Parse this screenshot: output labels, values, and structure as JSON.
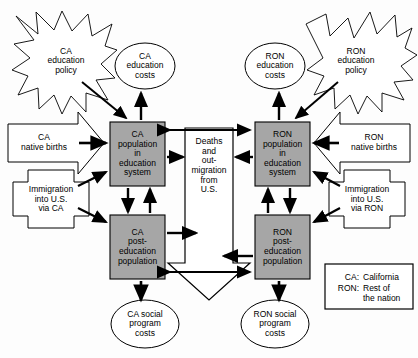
{
  "diagram": {
    "legend": {
      "name": "legend-box",
      "rows": [
        {
          "key": "CA:",
          "value": "California"
        },
        {
          "key": "RON:",
          "value": "Rest of\nthe nation"
        }
      ]
    },
    "nodes": {
      "ca_education_policy": {
        "label": "CA\neducation\npolicy",
        "shape": "starburst",
        "fill": "#ffffff"
      },
      "ca_education_costs": {
        "label": "CA\neducation\ncosts",
        "shape": "ellipse",
        "fill": "#ffffff"
      },
      "ron_education_costs": {
        "label": "RON\neducation\ncosts",
        "shape": "ellipse",
        "fill": "#ffffff"
      },
      "ron_education_policy": {
        "label": "RON\neducation\npolicy",
        "shape": "starburst",
        "fill": "#ffffff"
      },
      "ca_native_births": {
        "label": "CA\nnative births",
        "shape": "arrow-pentagon-right",
        "fill": "#ffffff"
      },
      "ron_native_births": {
        "label": "RON\nnative births",
        "shape": "arrow-pentagon-left",
        "fill": "#ffffff"
      },
      "ca_immigration": {
        "label": "Immigration\ninto U.S.\nvia CA",
        "shape": "cross",
        "fill": "#ffffff"
      },
      "ron_immigration": {
        "label": "Immigration\ninto U.S.\nvia RON",
        "shape": "cross",
        "fill": "#ffffff"
      },
      "ca_population_education": {
        "label": "CA\npopulation\nin\neducation\nsystem",
        "shape": "rect",
        "fill": "#a6a6a6"
      },
      "ron_population_education": {
        "label": "RON\npopulation\nin\neducation\nsystem",
        "shape": "rect",
        "fill": "#a6a6a6"
      },
      "ca_post_education": {
        "label": "CA\npost-\neducation\npopulation",
        "shape": "rect",
        "fill": "#a6a6a6"
      },
      "ron_post_education": {
        "label": "RON\npost-\neducation\npopulation",
        "shape": "rect",
        "fill": "#a6a6a6"
      },
      "deaths_outmigration": {
        "label": "Deaths\nand\nout-\nmigration\nfrom\nU.S.",
        "shape": "block-arrow-down",
        "fill": "#ffffff"
      },
      "ca_social_program_costs": {
        "label": "CA social\nprogram\ncosts",
        "shape": "ellipse",
        "fill": "#ffffff"
      },
      "ron_social_program_costs": {
        "label": "RON social\nprogram\ncosts",
        "shape": "ellipse",
        "fill": "#ffffff"
      }
    },
    "colors": {
      "box_fill": "#a6a6a6",
      "stroke": "#000000",
      "background": "#fdfdfd"
    }
  }
}
